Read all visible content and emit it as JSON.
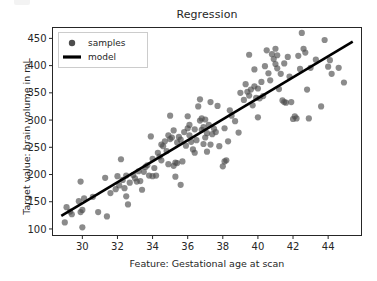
{
  "figure": {
    "background_color": "#ffffff",
    "axes_frame_color": "#262626",
    "marker_color": "#4d4d4d",
    "line_color": "#000000"
  },
  "chart_data": {
    "type": "scatter",
    "title": "Regression",
    "xlabel": "Feature: Gestational age at scan",
    "ylabel": "Target value: brain volume in mL",
    "xlim": [
      28.3,
      45.9
    ],
    "ylim": [
      88,
      470
    ],
    "xticks": [
      30,
      32,
      34,
      36,
      38,
      40,
      42,
      44
    ],
    "yticks": [
      100,
      150,
      200,
      250,
      300,
      350,
      400,
      450
    ],
    "grid": false,
    "legend_position": "upper left",
    "legend": [
      {
        "label": "samples",
        "marker": "circle",
        "color": "#4d4d4d"
      },
      {
        "label": "model",
        "marker": "line",
        "color": "#000000"
      }
    ],
    "series": [
      {
        "name": "samples",
        "type": "scatter",
        "color": "#4d4d4d",
        "alpha": 0.65,
        "marker_size": 3.1,
        "points": [
          [
            29.0,
            112
          ],
          [
            29.1,
            140
          ],
          [
            29.3,
            132
          ],
          [
            29.4,
            127
          ],
          [
            29.8,
            151
          ],
          [
            29.9,
            187
          ],
          [
            29.9,
            131
          ],
          [
            30.0,
            103
          ],
          [
            30.0,
            135
          ],
          [
            30.1,
            156
          ],
          [
            30.6,
            159
          ],
          [
            30.9,
            131
          ],
          [
            31.3,
            194
          ],
          [
            31.4,
            123
          ],
          [
            31.6,
            166
          ],
          [
            31.9,
            173
          ],
          [
            32.0,
            197
          ],
          [
            32.1,
            180
          ],
          [
            32.2,
            228
          ],
          [
            32.3,
            190
          ],
          [
            32.4,
            175
          ],
          [
            32.5,
            198
          ],
          [
            32.5,
            160
          ],
          [
            32.6,
            145
          ],
          [
            32.7,
            185
          ],
          [
            32.9,
            199
          ],
          [
            33.0,
            193
          ],
          [
            33.1,
            187
          ],
          [
            33.2,
            206
          ],
          [
            33.3,
            188
          ],
          [
            33.4,
            172
          ],
          [
            33.5,
            205
          ],
          [
            33.7,
            217
          ],
          [
            33.8,
            198
          ],
          [
            33.9,
            270
          ],
          [
            34.0,
            229
          ],
          [
            34.1,
            212
          ],
          [
            34.2,
            198
          ],
          [
            34.3,
            240
          ],
          [
            34.4,
            233
          ],
          [
            34.5,
            226
          ],
          [
            34.5,
            255
          ],
          [
            34.6,
            252
          ],
          [
            34.7,
            261
          ],
          [
            34.8,
            243
          ],
          [
            34.9,
            272
          ],
          [
            34.9,
            219
          ],
          [
            35.0,
            265
          ],
          [
            35.0,
            308
          ],
          [
            35.1,
            268
          ],
          [
            35.2,
            281
          ],
          [
            35.2,
            216
          ],
          [
            35.3,
            222
          ],
          [
            35.4,
            221
          ],
          [
            35.4,
            259
          ],
          [
            35.5,
            269
          ],
          [
            35.6,
            264
          ],
          [
            35.6,
            181
          ],
          [
            35.7,
            224
          ],
          [
            35.8,
            278
          ],
          [
            35.9,
            253
          ],
          [
            36.0,
            285
          ],
          [
            36.1,
            272
          ],
          [
            36.1,
            291
          ],
          [
            36.2,
            260
          ],
          [
            36.3,
            246
          ],
          [
            36.4,
            283
          ],
          [
            36.5,
            263
          ],
          [
            36.6,
            325
          ],
          [
            36.7,
            338
          ],
          [
            36.7,
            299
          ],
          [
            36.8,
            303
          ],
          [
            36.8,
            282
          ],
          [
            36.9,
            287
          ],
          [
            36.9,
            256
          ],
          [
            37.0,
            301
          ],
          [
            37.0,
            268
          ],
          [
            37.1,
            276
          ],
          [
            37.1,
            242
          ],
          [
            37.2,
            291
          ],
          [
            37.3,
            255
          ],
          [
            37.4,
            274
          ],
          [
            37.5,
            284
          ],
          [
            37.6,
            278
          ],
          [
            37.7,
            326
          ],
          [
            37.8,
            252
          ],
          [
            38.0,
            215
          ],
          [
            38.1,
            224
          ],
          [
            38.1,
            285
          ],
          [
            38.2,
            226
          ],
          [
            38.3,
            261
          ],
          [
            38.4,
            318
          ],
          [
            38.5,
            308
          ],
          [
            38.7,
            298
          ],
          [
            39.0,
            350
          ],
          [
            39.2,
            337
          ],
          [
            39.3,
            366
          ],
          [
            39.4,
            352
          ],
          [
            39.5,
            345
          ],
          [
            39.5,
            420
          ],
          [
            39.6,
            356
          ],
          [
            39.7,
            327
          ],
          [
            39.8,
            393
          ],
          [
            39.8,
            362
          ],
          [
            39.9,
            341
          ],
          [
            40.0,
            358
          ],
          [
            40.0,
            305
          ],
          [
            40.2,
            370
          ],
          [
            40.3,
            344
          ],
          [
            40.4,
            399
          ],
          [
            40.5,
            428
          ],
          [
            40.6,
            386
          ],
          [
            40.7,
            373
          ],
          [
            40.8,
            421
          ],
          [
            40.9,
            412
          ],
          [
            41.0,
            431
          ],
          [
            41.0,
            403
          ],
          [
            41.1,
            419
          ],
          [
            41.1,
            395
          ],
          [
            41.2,
            357
          ],
          [
            41.3,
            385
          ],
          [
            41.4,
            336
          ],
          [
            41.5,
            404
          ],
          [
            41.5,
            333
          ],
          [
            41.6,
            332
          ],
          [
            41.7,
            416
          ],
          [
            41.8,
            380
          ],
          [
            42.0,
            302
          ],
          [
            42.1,
            307
          ],
          [
            42.2,
            303
          ],
          [
            42.4,
            394
          ],
          [
            42.5,
            460
          ],
          [
            42.6,
            431
          ],
          [
            42.7,
            424
          ],
          [
            42.8,
            356
          ],
          [
            42.9,
            303
          ],
          [
            43.0,
            396
          ],
          [
            43.3,
            411
          ],
          [
            43.6,
            325
          ],
          [
            43.8,
            447
          ],
          [
            44.0,
            398
          ],
          [
            44.1,
            410
          ],
          [
            44.2,
            385
          ],
          [
            44.6,
            396
          ],
          [
            44.9,
            369
          ],
          [
            35.3,
            196
          ],
          [
            34.0,
            197
          ],
          [
            33.6,
            214
          ],
          [
            36.4,
            240
          ],
          [
            37.3,
            333
          ],
          [
            40.1,
            340
          ],
          [
            38.9,
            277
          ],
          [
            41.9,
            333
          ],
          [
            42.3,
            418
          ],
          [
            36.0,
            307
          ]
        ]
      },
      {
        "name": "model",
        "type": "line",
        "color": "#000000",
        "linewidth": 2.6,
        "endpoints": [
          [
            28.8,
            124
          ],
          [
            45.4,
            444
          ]
        ],
        "slope": 19.3,
        "intercept": -431.0
      }
    ]
  }
}
